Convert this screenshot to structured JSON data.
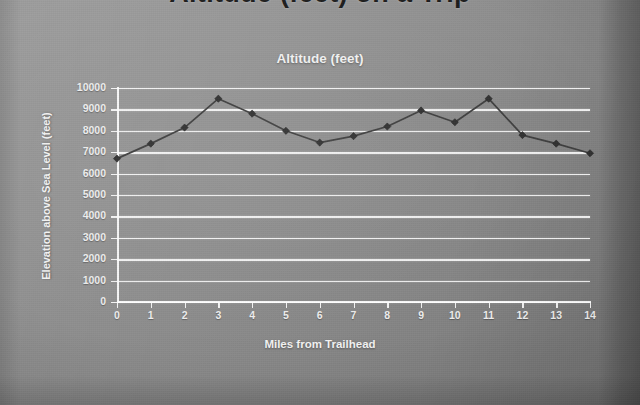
{
  "slide": {
    "title": "Altitude (feet) on a Trip",
    "background_color": "#8d8d8d"
  },
  "chart_data": {
    "type": "line",
    "title": "Altitude (feet)",
    "xlabel": "Miles from Trailhead",
    "ylabel": "Elevation above Sea Level (feet)",
    "x": [
      0,
      1,
      2,
      3,
      4,
      5,
      6,
      7,
      8,
      9,
      10,
      11,
      12,
      13,
      14
    ],
    "values": [
      6700,
      7400,
      8150,
      9500,
      8800,
      8000,
      7450,
      7750,
      8200,
      8950,
      8400,
      9500,
      7800,
      7400,
      6950
    ],
    "series": [
      {
        "name": "Altitude (feet)",
        "values": [
          6700,
          7400,
          8150,
          9500,
          8800,
          8000,
          7450,
          7750,
          8200,
          8950,
          8400,
          9500,
          7800,
          7400,
          6950
        ]
      }
    ],
    "xlim": [
      0,
      14
    ],
    "ylim": [
      0,
      10000
    ],
    "y_ticks": [
      0,
      1000,
      2000,
      3000,
      4000,
      5000,
      6000,
      7000,
      8000,
      9000,
      10000
    ],
    "x_ticks": [
      0,
      1,
      2,
      3,
      4,
      5,
      6,
      7,
      8,
      9,
      10,
      11,
      12,
      13,
      14
    ],
    "y_tick_labels": [
      "0",
      "1000",
      "2000",
      "3000",
      "4000",
      "5000",
      "6000",
      "7000",
      "8000",
      "9000",
      "10000"
    ],
    "x_tick_labels": [
      "0",
      "1",
      "2",
      "3",
      "4",
      "5",
      "6",
      "7",
      "8",
      "9",
      "10",
      "11",
      "12",
      "13",
      "14"
    ],
    "grid": true,
    "grid_color": "#ffffff",
    "legend": false,
    "legend_position": "none",
    "line_color": "#3c3c3c",
    "marker": "diamond",
    "marker_color": "#2e2e2e",
    "text_color": "#f0f0f0"
  }
}
